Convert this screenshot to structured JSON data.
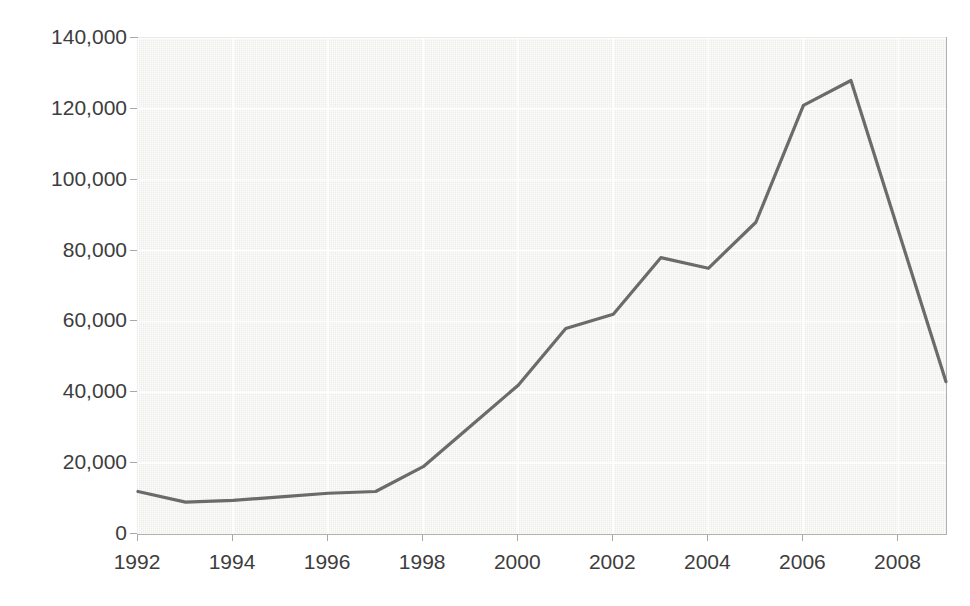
{
  "title": "",
  "chart_data": {
    "type": "line",
    "title": "",
    "subtitle": "",
    "xlabel": "",
    "ylabel": "",
    "x": [
      1992,
      1993,
      1994,
      1995,
      1996,
      1997,
      1998,
      1999,
      2000,
      2001,
      2002,
      2003,
      2004,
      2005,
      2006,
      2007,
      2009
    ],
    "values": [
      12000,
      9000,
      9500,
      10500,
      11500,
      12000,
      19000,
      30500,
      42000,
      58000,
      62000,
      78000,
      75000,
      88000,
      121000,
      128000,
      43000
    ],
    "series": [
      {
        "name": "series-1",
        "color": "#6b6b6b",
        "values": [
          12000,
          9000,
          9500,
          10500,
          11500,
          12000,
          19000,
          30500,
          42000,
          58000,
          62000,
          78000,
          75000,
          88000,
          121000,
          128000,
          43000
        ]
      }
    ],
    "xlim": [
      1992,
      2009
    ],
    "ylim": [
      0,
      140000
    ],
    "grid": true,
    "legend": "none",
    "plot_background": "#f2f2f0",
    "line_color": "#6b6b6b",
    "gridline_color": "#ffffff"
  },
  "axes": {
    "y_ticks": [
      {
        "label": "140,000",
        "value": 140000
      },
      {
        "label": "120,000",
        "value": 120000
      },
      {
        "label": "100,000",
        "value": 100000
      },
      {
        "label": "80,000",
        "value": 80000
      },
      {
        "label": "60,000",
        "value": 60000
      },
      {
        "label": "40,000",
        "value": 40000
      },
      {
        "label": "20,000",
        "value": 20000
      },
      {
        "label": "0",
        "value": 0
      }
    ],
    "x_ticks": [
      {
        "label": "1992",
        "value": 1992
      },
      {
        "label": "1994",
        "value": 1994
      },
      {
        "label": "1996",
        "value": 1996
      },
      {
        "label": "1998",
        "value": 1998
      },
      {
        "label": "2000",
        "value": 2000
      },
      {
        "label": "2002",
        "value": 2002
      },
      {
        "label": "2004",
        "value": 2004
      },
      {
        "label": "2006",
        "value": 2006
      },
      {
        "label": "2008",
        "value": 2008
      }
    ]
  }
}
